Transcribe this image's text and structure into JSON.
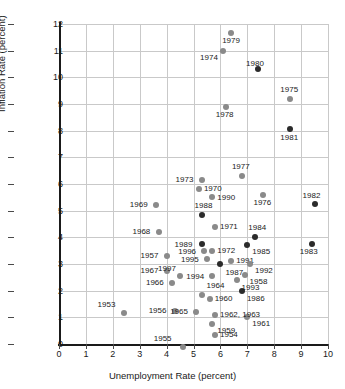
{
  "chart_data": {
    "type": "scatter",
    "title": "",
    "xlabel": "Unemployment Rate (percent)",
    "ylabel": "Inflation Rate (percent)",
    "xlim": [
      0,
      10
    ],
    "ylim": [
      0,
      12
    ],
    "xticks": [
      "0",
      "1",
      "2",
      "3",
      "4",
      "5",
      "6",
      "7",
      "8",
      "9",
      "10"
    ],
    "yticks": [
      "0",
      "1",
      "2",
      "3",
      "4",
      "5",
      "6",
      "7",
      "8",
      "9",
      "10",
      "11",
      "12"
    ],
    "grid": true,
    "legend": "none",
    "marker_colors": {
      "early": "#8a8a8a",
      "late": "#2b2b2b"
    },
    "points": [
      {
        "label": "1953",
        "x": 2.4,
        "y": 1.15,
        "shade": "grey",
        "lx": -26,
        "ly": -12
      },
      {
        "label": "1954",
        "x": 5.8,
        "y": 0.35,
        "shade": "grey",
        "lx": 5,
        "ly": -4
      },
      {
        "label": "1955",
        "x": 4.6,
        "y": -0.1,
        "shade": "grey",
        "lx": -29,
        "ly": -12
      },
      {
        "label": "1956",
        "x": 4.3,
        "y": 1.25,
        "shade": "grey",
        "lx": -26,
        "ly": -4
      },
      {
        "label": "1957",
        "x": 4.0,
        "y": 3.3,
        "shade": "grey",
        "lx": -26,
        "ly": -4
      },
      {
        "label": "1958",
        "x": 6.9,
        "y": 2.6,
        "shade": "grey",
        "lx": 5,
        "ly": 3
      },
      {
        "label": "1959",
        "x": 5.7,
        "y": 0.75,
        "shade": "grey",
        "lx": 5,
        "ly": 3
      },
      {
        "label": "1960",
        "x": 5.6,
        "y": 1.7,
        "shade": "grey",
        "lx": 5,
        "ly": -4
      },
      {
        "label": "1961",
        "x": 7.0,
        "y": 1.0,
        "shade": "grey",
        "lx": 5,
        "ly": 3
      },
      {
        "label": "1962, 1963",
        "x": 5.8,
        "y": 1.1,
        "shade": "grey",
        "lx": 5,
        "ly": -4
      },
      {
        "label": "1964",
        "x": 5.3,
        "y": 1.85,
        "shade": "grey",
        "lx": 5,
        "ly": -13
      },
      {
        "label": "1965",
        "x": 5.1,
        "y": 1.2,
        "shade": "grey",
        "lx": -26,
        "ly": -4
      },
      {
        "label": "1966",
        "x": 4.2,
        "y": 2.3,
        "shade": "grey",
        "lx": -26,
        "ly": -4
      },
      {
        "label": "1967",
        "x": 4.0,
        "y": 2.75,
        "shade": "grey",
        "lx": -26,
        "ly": -4
      },
      {
        "label": "1968",
        "x": 3.7,
        "y": 4.2,
        "shade": "grey",
        "lx": -26,
        "ly": -4
      },
      {
        "label": "1969",
        "x": 3.6,
        "y": 5.2,
        "shade": "grey",
        "lx": -26,
        "ly": -4
      },
      {
        "label": "1970",
        "x": 5.2,
        "y": 5.8,
        "shade": "grey",
        "lx": 5,
        "ly": -4
      },
      {
        "label": "1971",
        "x": 5.8,
        "y": 4.4,
        "shade": "grey",
        "lx": 5,
        "ly": -4
      },
      {
        "label": "1972",
        "x": 5.7,
        "y": 3.5,
        "shade": "grey",
        "lx": 5,
        "ly": -4
      },
      {
        "label": "1973",
        "x": 5.3,
        "y": 6.15,
        "shade": "grey",
        "lx": -26,
        "ly": -4
      },
      {
        "label": "1974",
        "x": 6.1,
        "y": 11.0,
        "shade": "grey",
        "lx": -23,
        "ly": 3
      },
      {
        "label": "1975",
        "x": 8.6,
        "y": 9.2,
        "shade": "grey",
        "lx": -10,
        "ly": -13
      },
      {
        "label": "1976",
        "x": 7.6,
        "y": 5.6,
        "shade": "grey",
        "lx": -10,
        "ly": 4
      },
      {
        "label": "1977",
        "x": 6.8,
        "y": 6.3,
        "shade": "grey",
        "lx": -10,
        "ly": -13
      },
      {
        "label": "1978",
        "x": 6.2,
        "y": 8.9,
        "shade": "grey",
        "lx": -10,
        "ly": 4
      },
      {
        "label": "1979",
        "x": 6.4,
        "y": 11.65,
        "shade": "grey",
        "lx": -9,
        "ly": 4
      },
      {
        "label": "1980",
        "x": 7.4,
        "y": 10.3,
        "shade": "dark",
        "lx": -12,
        "ly": -9
      },
      {
        "label": "1981",
        "x": 8.6,
        "y": 8.05,
        "shade": "dark",
        "lx": -10,
        "ly": 5
      },
      {
        "label": "1982",
        "x": 9.5,
        "y": 5.25,
        "shade": "dark",
        "lx": -12,
        "ly": -12
      },
      {
        "label": "1983",
        "x": 9.4,
        "y": 3.75,
        "shade": "dark",
        "lx": -12,
        "ly": 4
      },
      {
        "label": "1984",
        "x": 7.3,
        "y": 4.0,
        "shade": "dark",
        "lx": -7,
        "ly": -13
      },
      {
        "label": "1985",
        "x": 7.0,
        "y": 3.7,
        "shade": "dark",
        "lx": 5,
        "ly": 3
      },
      {
        "label": "1986",
        "x": 6.8,
        "y": 2.0,
        "shade": "dark",
        "lx": 5,
        "ly": 4
      },
      {
        "label": "1987",
        "x": 6.0,
        "y": 3.0,
        "shade": "dark",
        "lx": 5,
        "ly": 5
      },
      {
        "label": "1988",
        "x": 5.3,
        "y": 4.85,
        "shade": "dark",
        "lx": -7,
        "ly": -13
      },
      {
        "label": "1989",
        "x": 5.3,
        "y": 3.75,
        "shade": "dark",
        "lx": -27,
        "ly": -3
      },
      {
        "label": "1990",
        "x": 5.7,
        "y": 5.5,
        "shade": "grey",
        "lx": 5,
        "ly": -3
      },
      {
        "label": "1991",
        "x": 6.4,
        "y": 3.1,
        "shade": "grey",
        "lx": 5,
        "ly": -4
      },
      {
        "label": "1992",
        "x": 7.1,
        "y": 3.0,
        "shade": "grey",
        "lx": 5,
        "ly": 3
      },
      {
        "label": "1993",
        "x": 6.6,
        "y": 2.4,
        "shade": "grey",
        "lx": 5,
        "ly": 4
      },
      {
        "label": "1994",
        "x": 5.7,
        "y": 2.55,
        "shade": "grey",
        "lx": -26,
        "ly": -3
      },
      {
        "label": "1995",
        "x": 5.5,
        "y": 3.2,
        "shade": "grey",
        "lx": -26,
        "ly": -3
      },
      {
        "label": "1996",
        "x": 5.4,
        "y": 3.5,
        "shade": "grey",
        "lx": -26,
        "ly": -3
      },
      {
        "label": "1997",
        "x": 4.5,
        "y": 2.55,
        "shade": "grey",
        "lx": -22,
        "ly": -11
      }
    ]
  }
}
